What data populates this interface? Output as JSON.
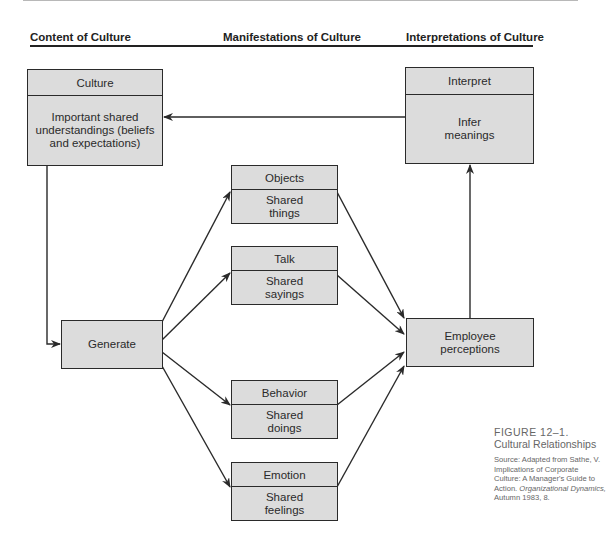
{
  "headers": {
    "content": "Content of Culture",
    "manifestations": "Manifestations of Culture",
    "interpretations": "Interpretations of Culture"
  },
  "boxes": {
    "culture": {
      "title": "Culture",
      "body": "Important shared understandings (beliefs and expectations)"
    },
    "interpret": {
      "title": "Interpret",
      "body": "Infer meanings"
    },
    "generate": {
      "label": "Generate"
    },
    "objects": {
      "title": "Objects",
      "body": "Shared things"
    },
    "talk": {
      "title": "Talk",
      "body": "Shared sayings"
    },
    "behavior": {
      "title": "Behavior",
      "body": "Shared doings"
    },
    "emotion": {
      "title": "Emotion",
      "body": "Shared feelings"
    },
    "employee": {
      "label": "Employee perceptions"
    }
  },
  "caption": {
    "figure_number": "FIGURE 12–1.",
    "title": "Cultural Relationships",
    "source_prefix": "Source: Adapted from Sathe, V. Implications of Corporate Culture: A Manager's Guide to Action.",
    "source_journal": "Organizational Dynamics,",
    "source_suffix": "Autumn 1983, 8."
  },
  "colors": {
    "box_fill": "#dcdcdc",
    "line": "#2a2a2a",
    "caption_text": "#666666"
  }
}
